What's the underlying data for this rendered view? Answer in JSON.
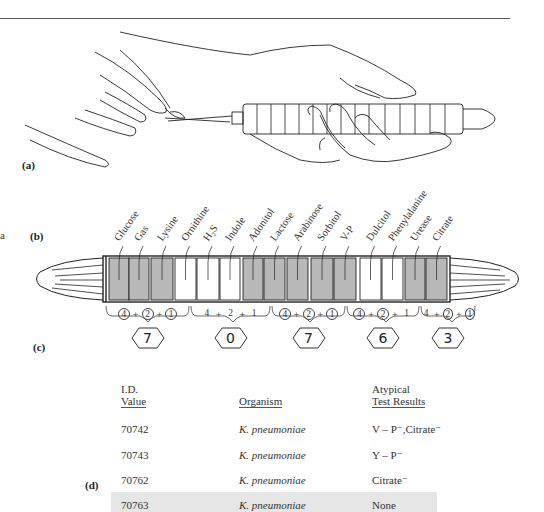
{
  "panels": {
    "a": {
      "label": "(a)"
    },
    "b": {
      "label": "(b)"
    },
    "c": {
      "label": "(c)"
    },
    "d": {
      "label": "(d)"
    }
  },
  "edge_fragment": "a",
  "strip": {
    "tests": [
      {
        "name": "Glucose",
        "positive": true
      },
      {
        "name": "Gas",
        "positive": true
      },
      {
        "name": "Lysine",
        "positive": true
      },
      {
        "name": "Ornithine",
        "positive": false
      },
      {
        "name": "H₂S",
        "positive": false
      },
      {
        "name": "Indole",
        "positive": false
      },
      {
        "name": "Adonitol",
        "positive": true
      },
      {
        "name": "Lactose",
        "positive": true
      },
      {
        "name": "Arabinose",
        "positive": true
      },
      {
        "name": "Sorbitol",
        "positive": true
      },
      {
        "name": "V-P",
        "positive": true
      },
      {
        "name": "Dulcitol",
        "positive": false
      },
      {
        "name": "Phenylalanine",
        "positive": false
      },
      {
        "name": "Urease",
        "positive": true
      },
      {
        "name": "Citrate",
        "positive": true
      }
    ],
    "colors": {
      "positive": "#b8b8b8",
      "negative": "#ffffff",
      "outline": "#222222"
    }
  },
  "groups": [
    {
      "values": [
        "4",
        "2",
        "1"
      ],
      "circled": [
        true,
        true,
        true
      ],
      "sum": "7"
    },
    {
      "values": [
        "4",
        "2",
        "1"
      ],
      "circled": [
        false,
        false,
        false
      ],
      "sum": "0"
    },
    {
      "values": [
        "4",
        "2",
        "1"
      ],
      "circled": [
        true,
        true,
        true
      ],
      "sum": "7"
    },
    {
      "values": [
        "4",
        "2",
        "1"
      ],
      "circled": [
        true,
        true,
        false
      ],
      "sum": "6"
    },
    {
      "values": [
        "4",
        "2",
        "1"
      ],
      "circled": [
        false,
        true,
        true
      ],
      "sum": "3"
    }
  ],
  "table": {
    "headers": {
      "id_line1": "I.D.",
      "id_line2": "Value",
      "organism": "Organism",
      "results_line1": "Atypical",
      "results_line2": "Test Results"
    },
    "rows": [
      {
        "id": "70742",
        "organism": "K. pneumoniae",
        "results": "V – P⁻,Citrate⁻",
        "highlight": false
      },
      {
        "id": "70743",
        "organism": "K. pneumoniae",
        "results": "Y – P⁻",
        "highlight": false
      },
      {
        "id": "70762",
        "organism": "K. pneumoniae",
        "results": "Citrate⁻",
        "highlight": false
      },
      {
        "id": "70763",
        "organism": "K. pneumoniae",
        "results": "None",
        "highlight": true
      }
    ],
    "highlight_color": "#e6e6e6"
  }
}
